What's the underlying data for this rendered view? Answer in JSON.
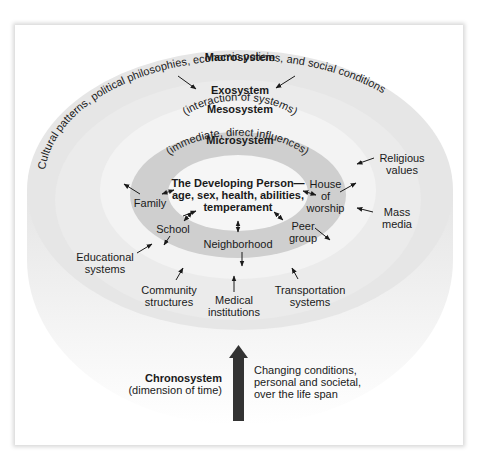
{
  "macrosystem": {
    "title": "Macrosystem",
    "description": "Cultural patterns, political philosophies, economic policies, and social conditions"
  },
  "exosystem": {
    "title": "Exosystem"
  },
  "mesosystem": {
    "title": "Mesosystem",
    "subtitle": "(interaction of systems)"
  },
  "microsystem": {
    "title": "Microsystem",
    "subtitle": "(immediate, direct influences)"
  },
  "center": {
    "line1": "The Developing Person—",
    "line2": "age, sex, health, abilities,",
    "line3": "temperament"
  },
  "micro_items": {
    "family": "Family",
    "school": "School",
    "neighborhood": "Neighborhood",
    "peer_group": [
      "Peer",
      "group"
    ],
    "house_of_worship": [
      "House",
      "of",
      "worship"
    ]
  },
  "exo_items": {
    "religious_values": [
      "Religious",
      "values"
    ],
    "mass_media": [
      "Mass",
      "media"
    ],
    "educational_systems": [
      "Educational",
      "systems"
    ],
    "community_structures": [
      "Community",
      "structures"
    ],
    "medical_institutions": [
      "Medical",
      "institutions"
    ],
    "transportation_systems": [
      "Transportation",
      "systems"
    ]
  },
  "chronosystem": {
    "title": "Chronosystem",
    "subtitle": "(dimension of time)",
    "description": [
      "Changing conditions,",
      "personal and societal,",
      "over the life span"
    ]
  },
  "colors": {
    "macro": "#e6e6e6",
    "exo": "#ececec",
    "meso": "#f3f3f3",
    "micro": "#cfcfcf",
    "center": "#f6f6f6",
    "arrow": "#333333"
  }
}
